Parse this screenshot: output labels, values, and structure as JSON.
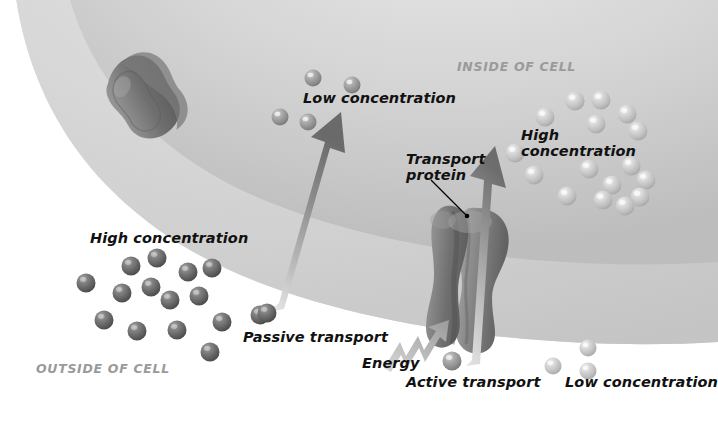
{
  "diagram": {
    "regions": [
      {
        "name": "inside-of-cell",
        "label": "INSIDE OF CELL",
        "x": 457,
        "y": 60,
        "color": "#9a9a9a"
      },
      {
        "name": "outside-of-cell",
        "label": "OUTSIDE OF CELL",
        "x": 36,
        "y": 362,
        "color": "#9a9a9a"
      }
    ],
    "labels": [
      {
        "name": "low-concentration-inside",
        "text": "Low concentration",
        "x": 303,
        "y": 90,
        "lines": [
          "Low concentration"
        ]
      },
      {
        "name": "high-concentration-inside",
        "text": "High concentration",
        "x": 521,
        "y": 128,
        "lines": [
          "High",
          "concentration"
        ]
      },
      {
        "name": "high-concentration-outside",
        "text": "High concentration",
        "x": 90,
        "y": 230,
        "lines": [
          "High concentration"
        ]
      },
      {
        "name": "low-concentration-outside",
        "text": "Low concentration",
        "x": 565,
        "y": 374,
        "lines": [
          "Low concentration"
        ]
      },
      {
        "name": "transport-protein",
        "text": "Transport protein",
        "x": 406,
        "y": 152,
        "lines": [
          "Transport",
          "protein"
        ]
      },
      {
        "name": "passive-transport",
        "text": "Passive transport",
        "x": 243,
        "y": 329,
        "lines": [
          "Passive transport"
        ]
      },
      {
        "name": "active-transport",
        "text": "Active transport",
        "x": 406,
        "y": 374,
        "lines": [
          "Active transport"
        ]
      },
      {
        "name": "energy",
        "text": "Energy",
        "x": 362,
        "y": 355,
        "lines": [
          "Energy"
        ]
      }
    ],
    "colors": {
      "background": "#ffffff",
      "cell_interior": "#c9c9c9",
      "cell_interior_light": "#e3e3e3",
      "membrane_band": "#dcdcdc",
      "protein": "#8c8c8c",
      "protein_dark": "#6b6b6b",
      "molecule_outside": "#6e6e6e",
      "molecule_inside": "#c4c4c4",
      "arrow_dark": "#6f6f6f",
      "arrow_light": "#dcdcdc",
      "region_text": "#9a9a9a",
      "label_text": "#111111",
      "leader_line": "#000000"
    },
    "molecules": {
      "outside_high_concentration": {
        "count": 15,
        "fill": "#6e6e6e",
        "radius": 9.5,
        "points": [
          {
            "x": 86,
            "y": 283
          },
          {
            "x": 131,
            "y": 266
          },
          {
            "x": 157,
            "y": 258
          },
          {
            "x": 188,
            "y": 272
          },
          {
            "x": 122,
            "y": 293
          },
          {
            "x": 151,
            "y": 287
          },
          {
            "x": 212,
            "y": 268
          },
          {
            "x": 170,
            "y": 300
          },
          {
            "x": 104,
            "y": 320
          },
          {
            "x": 199,
            "y": 296
          },
          {
            "x": 137,
            "y": 331
          },
          {
            "x": 177,
            "y": 330
          },
          {
            "x": 222,
            "y": 322
          },
          {
            "x": 210,
            "y": 352
          },
          {
            "x": 260,
            "y": 315
          }
        ]
      },
      "inside_high_concentration": {
        "count": 16,
        "fill": "#c4c4c4",
        "radius": 9.5,
        "points": [
          {
            "x": 575,
            "y": 101
          },
          {
            "x": 601,
            "y": 100
          },
          {
            "x": 545,
            "y": 117
          },
          {
            "x": 627,
            "y": 114
          },
          {
            "x": 596,
            "y": 124
          },
          {
            "x": 638,
            "y": 131
          },
          {
            "x": 515,
            "y": 153
          },
          {
            "x": 534,
            "y": 175
          },
          {
            "x": 589,
            "y": 169
          },
          {
            "x": 631,
            "y": 166
          },
          {
            "x": 646,
            "y": 180
          },
          {
            "x": 612,
            "y": 185
          },
          {
            "x": 567,
            "y": 196
          },
          {
            "x": 603,
            "y": 200
          },
          {
            "x": 640,
            "y": 197
          },
          {
            "x": 625,
            "y": 206
          }
        ]
      },
      "inside_low_concentration": {
        "count": 4,
        "fill": "#9d9d9d",
        "radius": 8.5,
        "points": [
          {
            "x": 313,
            "y": 78
          },
          {
            "x": 352,
            "y": 85
          },
          {
            "x": 280,
            "y": 117
          },
          {
            "x": 308,
            "y": 122
          }
        ]
      },
      "outside_low_concentration": {
        "count": 3,
        "fill": "#c4c4c4",
        "radius": 8.5,
        "points": [
          {
            "x": 588,
            "y": 348
          },
          {
            "x": 553,
            "y": 366
          },
          {
            "x": 588,
            "y": 371
          }
        ]
      },
      "passive_in_transit": {
        "count": 1,
        "fill": "#6e6e6e",
        "radius": 9.5,
        "points": [
          {
            "x": 267,
            "y": 313
          }
        ]
      },
      "active_in_transit": {
        "count": 1,
        "fill": "#8c8c8c",
        "radius": 9.5,
        "points": [
          {
            "x": 452,
            "y": 361
          }
        ]
      }
    },
    "arrows": [
      {
        "name": "passive-transport-arrow",
        "from": {
          "x": 277,
          "y": 300
        },
        "to": {
          "x": 341,
          "y": 118
        },
        "style": "gradient-light-to-dark"
      },
      {
        "name": "active-transport-arrow",
        "from": {
          "x": 472,
          "y": 352
        },
        "to": {
          "x": 494,
          "y": 148
        },
        "style": "gradient-light-to-dark"
      },
      {
        "name": "energy-arrow",
        "from": {
          "x": 383,
          "y": 364
        },
        "to": {
          "x": 447,
          "y": 330
        },
        "style": "lightning-bolt"
      }
    ],
    "proteins": [
      {
        "name": "membrane-protein-left",
        "x": 148,
        "y": 90,
        "rotation": -38
      },
      {
        "name": "transport-protein-channel",
        "x": 465,
        "y": 258,
        "rotation": 0
      }
    ],
    "leader_lines": [
      {
        "name": "transport-protein-leader",
        "from": {
          "x": 432,
          "y": 180
        },
        "to": {
          "x": 466,
          "y": 215
        }
      }
    ]
  }
}
